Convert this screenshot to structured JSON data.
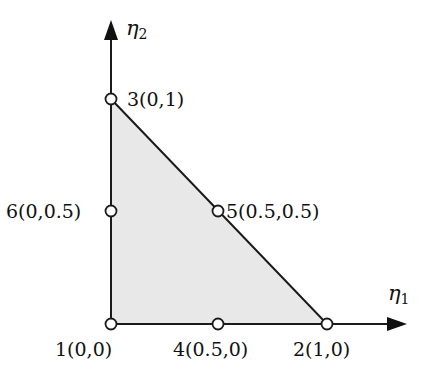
{
  "diagram": {
    "type": "reference-triangle",
    "colors": {
      "fill": "#e8e8e8",
      "stroke": "#1a1a1a",
      "node_fill": "#ffffff",
      "background": "#ffffff"
    },
    "axes": {
      "x": {
        "symbol": "η",
        "subscript": "1"
      },
      "y": {
        "symbol": "η",
        "subscript": "2"
      }
    },
    "nodes": [
      {
        "id": 1,
        "label": "1(0,0)",
        "eta1": 0,
        "eta2": 0
      },
      {
        "id": 2,
        "label": "2(1,0)",
        "eta1": 1,
        "eta2": 0
      },
      {
        "id": 3,
        "label": "3(0,1)",
        "eta1": 0,
        "eta2": 1
      },
      {
        "id": 4,
        "label": "4(0.5,0)",
        "eta1": 0.5,
        "eta2": 0
      },
      {
        "id": 5,
        "label": "5(0.5,0.5)",
        "eta1": 0.5,
        "eta2": 0.5
      },
      {
        "id": 6,
        "label": "6(0,0.5)",
        "eta1": 0,
        "eta2": 0.5
      }
    ]
  }
}
